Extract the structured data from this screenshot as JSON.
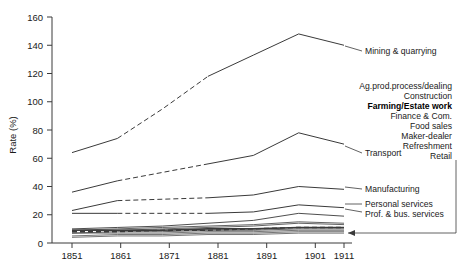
{
  "chart_data": {
    "type": "line",
    "title": "",
    "xlabel": "",
    "ylabel": "Rate (%)",
    "x": [
      1851,
      1861,
      1871,
      1881,
      1891,
      1901,
      1911
    ],
    "xticklabels": [
      "1851",
      "1861",
      "1871",
      "1881",
      "1891",
      "1901",
      "1911"
    ],
    "ylim": [
      0,
      160
    ],
    "yticks": [
      0,
      20,
      40,
      60,
      80,
      100,
      120,
      140,
      160
    ],
    "yticklabels": [
      "0",
      "20",
      "40",
      "60",
      "80",
      "100",
      "120",
      "140",
      "160"
    ],
    "grid": false,
    "legend_position": "right-inline-annotations",
    "series": [
      {
        "name": "Mining & quarrying",
        "values": [
          64,
          74,
          95,
          118,
          133,
          148,
          140
        ],
        "style": "solid-dashed-mixed",
        "width": 1.0
      },
      {
        "name": "Transport",
        "values": [
          36,
          44,
          50,
          56,
          62,
          78,
          70
        ],
        "style": "solid-dashed-mixed",
        "width": 1.0
      },
      {
        "name": "Manufacturing",
        "values": [
          23,
          30,
          31,
          32,
          34,
          40,
          38
        ],
        "style": "solid-dashed-mixed",
        "width": 1.0
      },
      {
        "name": "Personal services",
        "values": [
          21,
          21,
          21,
          21,
          22,
          27,
          25
        ],
        "style": "solid-dashed-mixed",
        "width": 1.0
      },
      {
        "name": "Prof. & bus. services",
        "values": [
          10,
          11,
          12,
          14,
          16,
          21,
          19
        ],
        "style": "solid",
        "width": 0.9
      },
      {
        "name": "Ag.prod.process/dealing",
        "values": [
          9,
          10,
          11,
          12,
          13,
          15,
          14
        ],
        "style": "solid",
        "width": 0.8
      },
      {
        "name": "Construction",
        "values": [
          9,
          9,
          10,
          11,
          12,
          14,
          13
        ],
        "style": "solid",
        "width": 0.8
      },
      {
        "name": "Farming/Estate work",
        "values": [
          9,
          9,
          9,
          10,
          10,
          11,
          11
        ],
        "style": "solid",
        "width": 1.6
      },
      {
        "name": "Finance & Com.",
        "values": [
          8,
          8,
          9,
          9,
          10,
          11,
          11
        ],
        "style": "dashed",
        "width": 1.4
      },
      {
        "name": "Food sales",
        "values": [
          7,
          8,
          8,
          9,
          9,
          10,
          10
        ],
        "style": "solid",
        "width": 0.8
      },
      {
        "name": "Maker-dealer",
        "values": [
          7,
          7,
          7,
          8,
          8,
          9,
          9
        ],
        "style": "solid",
        "width": 0.7
      },
      {
        "name": "Refreshment",
        "values": [
          5,
          6,
          6,
          7,
          7,
          8,
          8
        ],
        "style": "solid",
        "width": 0.7
      },
      {
        "name": "Retail",
        "values": [
          4,
          5,
          5,
          6,
          6,
          7,
          7
        ],
        "style": "solid",
        "width": 0.7
      }
    ]
  },
  "annotations": {
    "right_labels": [
      {
        "text": "Mining & quarrying",
        "bold": false
      },
      {
        "text": "Ag.prod.process/dealing",
        "bold": false
      },
      {
        "text": "Construction",
        "bold": false
      },
      {
        "text": "Farming/Estate work",
        "bold": true
      },
      {
        "text": "Finance & Com.",
        "bold": false
      },
      {
        "text": "Food sales",
        "bold": false
      },
      {
        "text": "Maker-dealer",
        "bold": false
      },
      {
        "text": "Refreshment",
        "bold": false
      },
      {
        "text": "Retail",
        "bold": false
      },
      {
        "text": "Transport",
        "bold": false
      },
      {
        "text": "Manufacturing",
        "bold": false
      },
      {
        "text": "Personal services",
        "bold": false
      },
      {
        "text": "Prof. & bus. services",
        "bold": false
      }
    ]
  },
  "labels": {
    "mining": "Mining & quarrying",
    "agprod": "Ag.prod.process/dealing",
    "construction": "Construction",
    "farming": "Farming/Estate work",
    "finance": "Finance & Com.",
    "foodsales": "Food sales",
    "makerdealer": "Maker-dealer",
    "refreshment": "Refreshment",
    "retail": "Retail",
    "transport": "Transport",
    "manufacturing": "Manufacturing",
    "personal": "Personal services",
    "profbus": "Prof. & bus. services",
    "yaxis": "Rate (%)",
    "y160": "160",
    "y140": "140",
    "y120": "120",
    "y100": "100",
    "y80": "80",
    "y60": "60",
    "y40": "40",
    "y20": "20",
    "y0": "0",
    "x1851": "1851",
    "x1861": "1861",
    "x1871": "1871",
    "x1881": "1881",
    "x1891": "1891",
    "x1901": "1901",
    "x1911": "1911"
  },
  "colors": {
    "line": "#3a3a3a",
    "axis": "#3a3a3a",
    "text": "#1a1a1a",
    "background": "#ffffff"
  }
}
